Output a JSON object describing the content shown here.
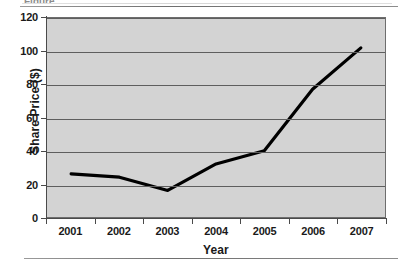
{
  "figure": {
    "background_color": "#ffffff",
    "plot_background_color": "#d3d3d3",
    "line_color": "#000000",
    "gridline_color": "#5e5e5e",
    "axis_color": "#4a4a4a",
    "clipped_caption_fragment": "Figure"
  },
  "chart_data": {
    "type": "line",
    "title": "",
    "xlabel": "Year",
    "ylabel": "Share Price ($)",
    "categories": [
      "2001",
      "2002",
      "2003",
      "2004",
      "2005",
      "2006",
      "2007"
    ],
    "values": [
      26,
      24,
      16,
      32,
      40,
      77,
      102
    ],
    "series": [
      {
        "name": "Share Price",
        "values": [
          26,
          24,
          16,
          32,
          40,
          77,
          102
        ]
      }
    ],
    "ylim": [
      0,
      120
    ],
    "ytick_labels": [
      "0",
      "20",
      "40",
      "60",
      "80",
      "100",
      "120"
    ],
    "ytick_values": [
      0,
      20,
      40,
      60,
      80,
      100,
      120
    ],
    "xtick_labels": [
      "2001",
      "2002",
      "2003",
      "2004",
      "2005",
      "2006",
      "2007"
    ],
    "grid": "horizontal",
    "legend": "none",
    "annotations": []
  }
}
